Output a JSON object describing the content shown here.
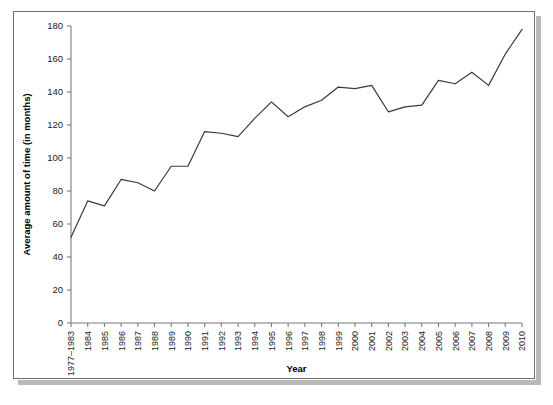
{
  "chart_data": {
    "type": "line",
    "title": "",
    "xlabel": "Year",
    "ylabel": "Average amount of time (in months)",
    "ylim": [
      0,
      180
    ],
    "ytick_step": 20,
    "yticks": [
      0,
      20,
      40,
      60,
      80,
      100,
      120,
      140,
      160,
      180
    ],
    "grid": false,
    "legend": null,
    "line_color": "#3a3a3a",
    "categories": [
      "1977–1983",
      "1984",
      "1985",
      "1986",
      "1987",
      "1988",
      "1989",
      "1990",
      "1991",
      "1992",
      "1993",
      "1994",
      "1995",
      "1996",
      "1997",
      "1998",
      "1999",
      "2000",
      "2001",
      "2002",
      "2003",
      "2004",
      "2005",
      "2006",
      "2007",
      "2008",
      "2009",
      "2010"
    ],
    "values": [
      52,
      74,
      71,
      87,
      85,
      80,
      95,
      95,
      116,
      115,
      113,
      124,
      134,
      125,
      131,
      135,
      143,
      142,
      144,
      128,
      131,
      132,
      147,
      145,
      152,
      144,
      163,
      178
    ]
  },
  "axis": {
    "y_title": "Average amount of time (in months)",
    "x_title": "Year"
  }
}
